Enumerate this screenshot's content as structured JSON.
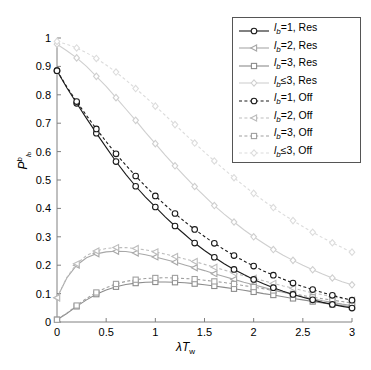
{
  "chart_data": {
    "type": "line",
    "title": "",
    "xlabel": "λT_w",
    "ylabel": "P_{l_b}^{b}",
    "xlim": [
      0,
      3
    ],
    "ylim": [
      0,
      1
    ],
    "xticks": [
      "0",
      "0.5",
      "1",
      "1.5",
      "2",
      "2.5",
      "3"
    ],
    "yticks": [
      "0",
      "0.1",
      "0.2",
      "0.3",
      "0.4",
      "0.5",
      "0.6",
      "0.7",
      "0.8",
      "0.9",
      "1"
    ],
    "grid": false,
    "legend_position": "top-right",
    "x": [
      0,
      0.1,
      0.2,
      0.3,
      0.4,
      0.5,
      0.6,
      0.7,
      0.8,
      0.9,
      1.0,
      1.1,
      1.2,
      1.3,
      1.4,
      1.5,
      1.6,
      1.7,
      1.8,
      1.9,
      2.0,
      2.1,
      2.2,
      2.3,
      2.4,
      2.5,
      2.6,
      2.7,
      2.8,
      2.9,
      3.0
    ],
    "series": [
      {
        "name": "lb1res",
        "label_prefix": "l",
        "label_sub": "b",
        "label_rel": "=1, Res",
        "marker": "circle",
        "linestyle": "solid",
        "color": "#1a1a1a",
        "values": [
          0.885,
          0.825,
          0.77,
          0.717,
          0.665,
          0.615,
          0.565,
          0.52,
          0.478,
          0.44,
          0.405,
          0.37,
          0.338,
          0.308,
          0.278,
          0.252,
          0.228,
          0.205,
          0.185,
          0.167,
          0.15,
          0.135,
          0.121,
          0.108,
          0.097,
          0.087,
          0.078,
          0.069,
          0.062,
          0.055,
          0.049
        ]
      },
      {
        "name": "lb2res",
        "label_prefix": "l",
        "label_sub": "b",
        "label_rel": "=2, Res",
        "marker": "triangle-left",
        "linestyle": "solid",
        "color": "#a8a8a8",
        "values": [
          0.085,
          0.155,
          0.2,
          0.226,
          0.24,
          0.247,
          0.249,
          0.248,
          0.243,
          0.237,
          0.229,
          0.22,
          0.211,
          0.201,
          0.191,
          0.181,
          0.17,
          0.16,
          0.15,
          0.14,
          0.131,
          0.122,
          0.113,
          0.105,
          0.097,
          0.089,
          0.082,
          0.075,
          0.069,
          0.063,
          0.058
        ]
      },
      {
        "name": "lb3res",
        "label_prefix": "l",
        "label_sub": "b",
        "label_rel": "=3, Res",
        "marker": "square",
        "linestyle": "solid",
        "color": "#8c8c8c",
        "values": [
          0.008,
          0.03,
          0.055,
          0.078,
          0.098,
          0.113,
          0.124,
          0.132,
          0.137,
          0.14,
          0.141,
          0.141,
          0.14,
          0.138,
          0.135,
          0.131,
          0.127,
          0.122,
          0.117,
          0.112,
          0.106,
          0.1,
          0.095,
          0.089,
          0.083,
          0.078,
          0.072,
          0.067,
          0.062,
          0.058,
          0.053
        ]
      },
      {
        "name": "lble3res",
        "label_prefix": "l",
        "label_sub": "b",
        "label_rel": "≤3, Res",
        "marker": "diamond",
        "linestyle": "solid",
        "color": "#cfcfcf",
        "values": [
          0.978,
          0.955,
          0.93,
          0.9,
          0.865,
          0.83,
          0.79,
          0.75,
          0.71,
          0.668,
          0.628,
          0.588,
          0.55,
          0.513,
          0.477,
          0.443,
          0.41,
          0.38,
          0.352,
          0.325,
          0.3,
          0.277,
          0.255,
          0.235,
          0.217,
          0.2,
          0.184,
          0.169,
          0.155,
          0.142,
          0.131
        ]
      },
      {
        "name": "lb1off",
        "label_prefix": "l",
        "label_sub": "b",
        "label_rel": "=1, Off",
        "marker": "circle",
        "linestyle": "dashed",
        "color": "#1a1a1a",
        "values": [
          0.885,
          0.828,
          0.776,
          0.727,
          0.68,
          0.635,
          0.592,
          0.552,
          0.514,
          0.478,
          0.444,
          0.412,
          0.382,
          0.353,
          0.326,
          0.301,
          0.277,
          0.255,
          0.234,
          0.215,
          0.197,
          0.18,
          0.165,
          0.151,
          0.137,
          0.125,
          0.114,
          0.104,
          0.094,
          0.085,
          0.077
        ]
      },
      {
        "name": "lb2off",
        "label_prefix": "l",
        "label_sub": "b",
        "label_rel": "=2, Off",
        "marker": "triangle-left",
        "linestyle": "dashed",
        "color": "#bdbdbd",
        "values": [
          0.085,
          0.157,
          0.205,
          0.234,
          0.25,
          0.259,
          0.262,
          0.262,
          0.259,
          0.254,
          0.247,
          0.239,
          0.231,
          0.222,
          0.213,
          0.203,
          0.193,
          0.183,
          0.173,
          0.163,
          0.154,
          0.145,
          0.136,
          0.127,
          0.119,
          0.111,
          0.103,
          0.096,
          0.089,
          0.083,
          0.077
        ]
      },
      {
        "name": "lb3off",
        "label_prefix": "l",
        "label_sub": "b",
        "label_rel": "=3, Off",
        "marker": "square",
        "linestyle": "dashed",
        "color": "#a0a0a0",
        "values": [
          0.008,
          0.031,
          0.058,
          0.083,
          0.104,
          0.121,
          0.134,
          0.143,
          0.149,
          0.153,
          0.155,
          0.156,
          0.155,
          0.153,
          0.151,
          0.147,
          0.143,
          0.139,
          0.134,
          0.128,
          0.123,
          0.117,
          0.111,
          0.105,
          0.099,
          0.093,
          0.087,
          0.082,
          0.077,
          0.072,
          0.067
        ]
      },
      {
        "name": "lble3off",
        "label_prefix": "l",
        "label_sub": "b",
        "label_rel": "≤3, Off",
        "marker": "diamond",
        "linestyle": "dashed",
        "color": "#dcdcdc",
        "values": [
          0.988,
          0.978,
          0.965,
          0.948,
          0.928,
          0.905,
          0.88,
          0.852,
          0.822,
          0.792,
          0.76,
          0.728,
          0.695,
          0.662,
          0.63,
          0.598,
          0.567,
          0.537,
          0.508,
          0.48,
          0.453,
          0.427,
          0.403,
          0.379,
          0.357,
          0.336,
          0.316,
          0.297,
          0.279,
          0.262,
          0.246
        ]
      }
    ]
  },
  "axes": {
    "x_label_lambda": "λ",
    "x_label_T": "T",
    "x_label_sub": "w",
    "y_label_P": "P",
    "y_label_sub": "l",
    "y_label_subsub": "b",
    "y_label_sup": "b"
  },
  "legend": {
    "entries": [
      {
        "marker": "circle",
        "linestyle": "solid",
        "color": "#1a1a1a",
        "prefix": "l",
        "sub": "b",
        "rest": "=1, Res"
      },
      {
        "marker": "triangle-left",
        "linestyle": "solid",
        "color": "#a8a8a8",
        "prefix": "l",
        "sub": "b",
        "rest": "=2, Res"
      },
      {
        "marker": "square",
        "linestyle": "solid",
        "color": "#8c8c8c",
        "prefix": "l",
        "sub": "b",
        "rest": "=3, Res"
      },
      {
        "marker": "diamond",
        "linestyle": "solid",
        "color": "#cfcfcf",
        "prefix": "l",
        "sub": "b",
        "rest": "≤3, Res"
      },
      {
        "marker": "circle",
        "linestyle": "dashed",
        "color": "#1a1a1a",
        "prefix": "l",
        "sub": "b",
        "rest": "=1, Off"
      },
      {
        "marker": "triangle-left",
        "linestyle": "dashed",
        "color": "#bdbdbd",
        "prefix": "l",
        "sub": "b",
        "rest": "=2, Off"
      },
      {
        "marker": "square",
        "linestyle": "dashed",
        "color": "#a0a0a0",
        "prefix": "l",
        "sub": "b",
        "rest": "=3, Off"
      },
      {
        "marker": "diamond",
        "linestyle": "dashed",
        "color": "#dcdcdc",
        "prefix": "l",
        "sub": "b",
        "rest": "≤3, Off"
      }
    ]
  }
}
